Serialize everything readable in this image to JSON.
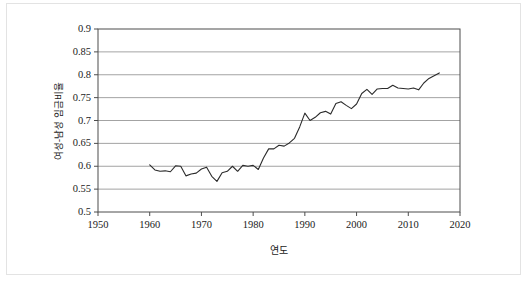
{
  "figure": {
    "background_color": "#ffffff",
    "frame_color": "#e3e3e3",
    "axis_color": "#4d4d4d",
    "grid_color": "#8c8c8c",
    "line_color": "#2b2b2b"
  },
  "chart_data": {
    "type": "line",
    "title": "",
    "subtitle": "",
    "xlabel": "연도",
    "ylabel": "여성-남성 임금비율",
    "xlim": [
      1950,
      2020
    ],
    "ylim": [
      0.5,
      0.9
    ],
    "xticks": [
      1950,
      1960,
      1970,
      1980,
      1990,
      2000,
      2010,
      2020
    ],
    "yticks": [
      0.5,
      0.55,
      0.6,
      0.65,
      0.7,
      0.75,
      0.8,
      0.85,
      0.9
    ],
    "xtick_labels": [
      "1950",
      "1960",
      "1970",
      "1980",
      "1990",
      "2000",
      "2010",
      "2020"
    ],
    "ytick_labels": [
      "0.5",
      "0.55",
      "0.6",
      "0.65",
      "0.7",
      "0.75",
      "0.8",
      "0.85",
      "0.9"
    ],
    "grid": "horizontal",
    "legend": "none",
    "annotations": [],
    "series": [
      {
        "name": "여성-남성 임금비율",
        "x": [
          1960,
          1961,
          1962,
          1963,
          1964,
          1965,
          1966,
          1967,
          1968,
          1969,
          1970,
          1971,
          1972,
          1973,
          1974,
          1975,
          1976,
          1977,
          1978,
          1979,
          1980,
          1981,
          1982,
          1983,
          1984,
          1985,
          1986,
          1987,
          1988,
          1989,
          1990,
          1991,
          1992,
          1993,
          1994,
          1995,
          1996,
          1997,
          1998,
          1999,
          2000,
          2001,
          2002,
          2003,
          2004,
          2005,
          2006,
          2007,
          2008,
          2009,
          2010,
          2011,
          2012,
          2013,
          2014,
          2015,
          2016
        ],
        "values": [
          0.603,
          0.592,
          0.589,
          0.59,
          0.588,
          0.601,
          0.6,
          0.579,
          0.583,
          0.585,
          0.594,
          0.598,
          0.578,
          0.567,
          0.586,
          0.589,
          0.6,
          0.589,
          0.602,
          0.6,
          0.602,
          0.593,
          0.618,
          0.638,
          0.638,
          0.646,
          0.644,
          0.651,
          0.661,
          0.686,
          0.716,
          0.7,
          0.707,
          0.717,
          0.72,
          0.714,
          0.737,
          0.741,
          0.733,
          0.726,
          0.736,
          0.759,
          0.768,
          0.757,
          0.769,
          0.77,
          0.77,
          0.777,
          0.771,
          0.77,
          0.769,
          0.771,
          0.767,
          0.782,
          0.792,
          0.798,
          0.804
        ]
      }
    ]
  },
  "axes_geometry": {
    "left_px": 98,
    "right_px": 460,
    "top_px": 29,
    "bottom_px": 212
  }
}
